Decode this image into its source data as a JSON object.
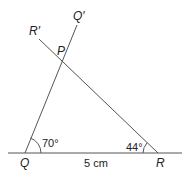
{
  "diagram": {
    "type": "triangle-construction",
    "points": {
      "Q": {
        "label": "Q",
        "x": 25,
        "y": 153
      },
      "R": {
        "label": "R",
        "x": 158,
        "y": 153
      },
      "P": {
        "label": "P",
        "x": 63,
        "y": 62
      },
      "Q_prime": {
        "label": "Q′",
        "x": 77,
        "y": 25
      },
      "R_prime": {
        "label": "R′",
        "x": 39,
        "y": 39
      }
    },
    "base": {
      "length_label": "5 cm",
      "x1": 8,
      "x2": 182,
      "y": 153
    },
    "angles": {
      "at_Q": {
        "label": "70°",
        "value": 70
      },
      "at_R": {
        "label": "44°",
        "value": 44
      }
    },
    "stroke_color": "#555555",
    "text_color": "#222222"
  }
}
